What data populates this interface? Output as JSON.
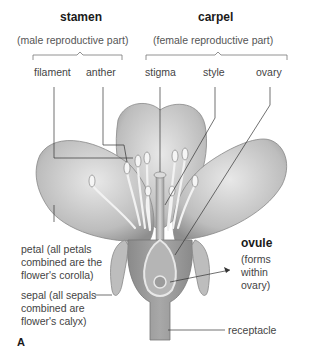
{
  "diagram": {
    "panel_letter": "A",
    "groups": {
      "stamen": {
        "title": "stamen",
        "subtitle": "(male reproductive part)",
        "parts": [
          "filament",
          "anther"
        ]
      },
      "carpel": {
        "title": "carpel",
        "subtitle": "(female reproductive part)",
        "parts": [
          "stigma",
          "style",
          "ovary"
        ]
      }
    },
    "labels": {
      "petal": [
        "petal (all petals",
        "combined are the",
        "flower's corolla)"
      ],
      "sepal": [
        "sepal (all sepals",
        "combined are",
        "flower's calyx)"
      ],
      "ovule_title": "ovule",
      "ovule_desc": [
        "(forms",
        "within",
        "ovary)"
      ],
      "receptacle": "receptacle"
    }
  }
}
